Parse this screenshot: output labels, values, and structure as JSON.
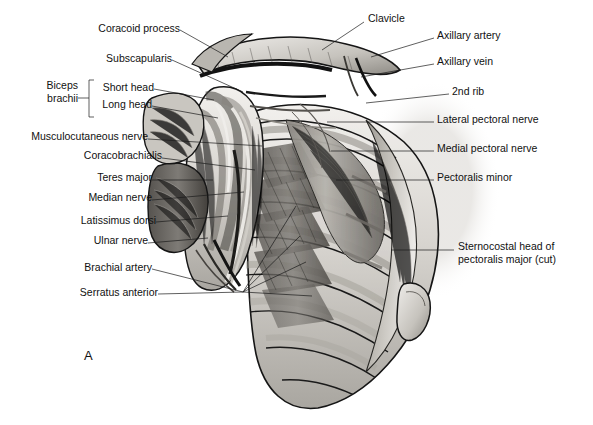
{
  "figure": {
    "panel_letter": "A",
    "title_text": "",
    "background_color": "#ffffff",
    "ink_color": "#1b1b1b",
    "style": "grayscale anatomical illustration"
  },
  "labels_left": [
    {
      "id": "coracoid-process",
      "text": "Coracoid process",
      "x": 95,
      "y": 27,
      "leader": [
        [
          180,
          30
        ],
        [
          228,
          57
        ]
      ]
    },
    {
      "id": "subscapularis",
      "text": "Subscapularis",
      "x": 105,
      "y": 57,
      "leader": [
        [
          172,
          60
        ],
        [
          243,
          92
        ]
      ]
    },
    {
      "id": "biceps-brachii",
      "text": "Biceps\nbrachii",
      "x": 38,
      "y": 84,
      "leader": []
    },
    {
      "id": "short-head",
      "text": "Short head",
      "x": 96,
      "y": 86,
      "leader": [
        [
          154,
          89
        ],
        [
          214,
          100
        ]
      ]
    },
    {
      "id": "long-head",
      "text": "Long head",
      "x": 98,
      "y": 103,
      "leader": [
        [
          152,
          106
        ],
        [
          218,
          118
        ]
      ]
    },
    {
      "id": "musculocutaneous-nerve",
      "text": "Musculocutaneous nerve",
      "x": 28,
      "y": 135,
      "leader": [
        [
          148,
          139
        ],
        [
          262,
          146
        ]
      ]
    },
    {
      "id": "coracobrachialis",
      "text": "Coracobrachialis",
      "x": 72,
      "y": 154,
      "leader": [
        [
          162,
          158
        ],
        [
          255,
          170
        ]
      ]
    },
    {
      "id": "teres-major",
      "text": "Teres major",
      "x": 88,
      "y": 176,
      "leader": [
        [
          152,
          180
        ],
        [
          213,
          180
        ]
      ]
    },
    {
      "id": "median-nerve",
      "text": "Median nerve",
      "x": 84,
      "y": 196,
      "leader": [
        [
          152,
          200
        ],
        [
          244,
          192
        ]
      ]
    },
    {
      "id": "latissimus-dorsi",
      "text": "Latissimus dorsi",
      "x": 68,
      "y": 219,
      "leader": [
        [
          156,
          222
        ],
        [
          228,
          216
        ]
      ]
    },
    {
      "id": "ulnar-nerve",
      "text": "Ulnar nerve",
      "x": 86,
      "y": 240,
      "leader": [
        [
          148,
          243
        ],
        [
          208,
          238
        ]
      ]
    },
    {
      "id": "brachial-artery",
      "text": "Brachial artery",
      "x": 78,
      "y": 266,
      "leader": [
        [
          152,
          269
        ],
        [
          243,
          292
        ]
      ]
    },
    {
      "id": "serratus-anterior",
      "text": "Serratus anterior",
      "x": 72,
      "y": 291,
      "leader": [
        [
          158,
          294
        ],
        [
          243,
          292
        ]
      ]
    }
  ],
  "labels_right": [
    {
      "id": "clavicle",
      "text": "Clavicle",
      "x": 368,
      "y": 17,
      "leader": [
        [
          364,
          22
        ],
        [
          322,
          50
        ]
      ]
    },
    {
      "id": "axillary-artery",
      "text": "Axillary artery",
      "x": 437,
      "y": 34,
      "leader": [
        [
          434,
          38
        ],
        [
          371,
          57
        ]
      ]
    },
    {
      "id": "axillary-vein",
      "text": "Axillary vein",
      "x": 437,
      "y": 60,
      "leader": [
        [
          434,
          64
        ],
        [
          361,
          77
        ]
      ]
    },
    {
      "id": "2nd-rib",
      "text": "2nd rib",
      "x": 452,
      "y": 90,
      "leader": [
        [
          449,
          94
        ],
        [
          366,
          103
        ]
      ]
    },
    {
      "id": "lateral-pectoral-nerve",
      "text": "Lateral pectoral nerve",
      "x": 437,
      "y": 118,
      "leader": [
        [
          434,
          122
        ],
        [
          327,
          122
        ]
      ]
    },
    {
      "id": "medial-pectoral-nerve",
      "text": "Medial pectoral nerve",
      "x": 437,
      "y": 147,
      "leader": [
        [
          434,
          151
        ],
        [
          331,
          151
        ]
      ]
    },
    {
      "id": "pectoralis-minor",
      "text": "Pectoralis minor",
      "x": 437,
      "y": 176,
      "leader": [
        [
          434,
          180
        ],
        [
          336,
          180
        ]
      ]
    },
    {
      "id": "sternocostal-head",
      "text": "Sternocostal head of\npectoralis major (cut)",
      "x": 458,
      "y": 245,
      "leader": [
        [
          454,
          250
        ],
        [
          391,
          250
        ]
      ]
    }
  ],
  "bracket": {
    "id": "biceps-brachii-bracket",
    "label_ref": "biceps-brachii",
    "x": 89,
    "y_top": 80,
    "y_bottom": 117,
    "tick": 5,
    "stem": [
      [
        78,
        98
      ],
      [
        89,
        98
      ]
    ]
  },
  "colors": {
    "background": "#ffffff",
    "text": "#111111",
    "leader_line": "#1b1b1b",
    "bone_light": "#e8e6e2",
    "bone_mid": "#cfccc6",
    "muscle_light": "#d9d6d1",
    "muscle_mid": "#a8a49d",
    "muscle_dark": "#6d6a65",
    "shadow_dark": "#3a3834",
    "outline": "#151515"
  }
}
